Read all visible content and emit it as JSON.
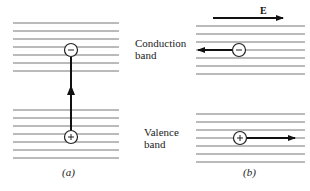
{
  "figure": {
    "panel_a": {
      "caption": "(a)"
    },
    "panel_b": {
      "caption": "(b)",
      "field_label": "E"
    },
    "labels": {
      "conduction_line1": "Conduction",
      "conduction_line2": "band",
      "valence_line1": "Valence",
      "valence_line2": "band"
    },
    "symbols": {
      "electron": "−",
      "hole": "+"
    }
  }
}
